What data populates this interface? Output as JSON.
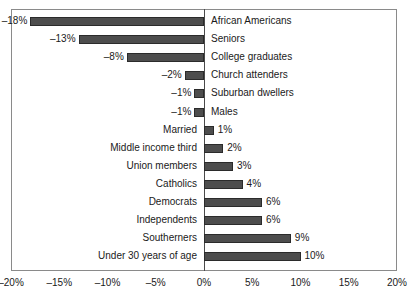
{
  "chart_data": {
    "type": "bar",
    "orientation": "horizontal",
    "title": "",
    "xlabel": "",
    "ylabel": "",
    "xlim": [
      -20,
      20
    ],
    "grid": false,
    "legend": null,
    "bar_color": "#4d4d4d",
    "axis_color": "#8a8a8a",
    "xticks": [
      -20,
      -15,
      -10,
      -5,
      0,
      5,
      10,
      15,
      20
    ],
    "xticklabels": [
      "–20%",
      "–15%",
      "–10%",
      "–5%",
      "0%",
      "5%",
      "10%",
      "15%",
      "20%"
    ],
    "categories": [
      "African Americans",
      "Seniors",
      "College graduates",
      "Church attenders",
      "Suburban dwellers",
      "Males",
      "Married",
      "Middle income third",
      "Union members",
      "Catholics",
      "Democrats",
      "Independents",
      "Southerners",
      "Under 30 years of age"
    ],
    "values": [
      -18,
      -13,
      -8,
      -2,
      -1,
      -1,
      1,
      2,
      3,
      4,
      6,
      6,
      9,
      10
    ],
    "value_labels": [
      "–18%",
      "–13%",
      "–8%",
      "–2%",
      "–1%",
      "–1%",
      "1%",
      "2%",
      "3%",
      "4%",
      "6%",
      "6%",
      "9%",
      "10%"
    ]
  }
}
